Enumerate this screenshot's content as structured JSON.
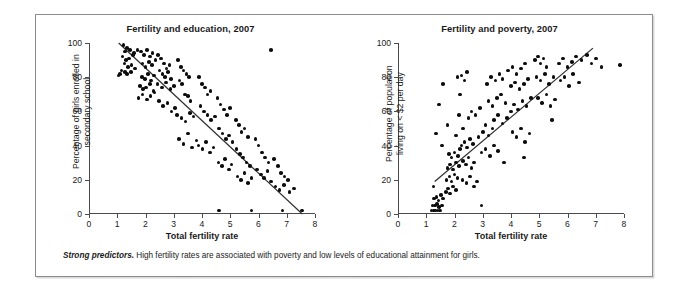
{
  "caption": {
    "lead": "Strong predictors.",
    "text": " High fertility rates are associated with poverty and low levels of educational attainment for girls."
  },
  "chart_data": [
    {
      "type": "scatter",
      "id": "fertility-education",
      "title": "Fertility and education, 2007",
      "xlabel": "Total fertility rate",
      "ylabel": "Percentage of girls enrolled in\nsecondary school",
      "xlim": [
        0,
        8
      ],
      "ylim": [
        0,
        100
      ],
      "xticks": [
        0,
        1,
        2,
        3,
        4,
        5,
        6,
        7,
        8
      ],
      "yticks": [
        0,
        20,
        40,
        60,
        80,
        100
      ],
      "grid": false,
      "legend": "none",
      "point_color": "#0d0d0d",
      "trendline": {
        "x0": 1.05,
        "y0": 100,
        "x1": 7.55,
        "y1": 0,
        "color": "#2e2e33"
      },
      "points": [
        [
          1.22,
          99
        ],
        [
          1.35,
          97
        ],
        [
          1.28,
          95
        ],
        [
          1.45,
          96
        ],
        [
          1.55,
          93
        ],
        [
          1.18,
          92
        ],
        [
          1.3,
          90
        ],
        [
          1.42,
          91
        ],
        [
          1.6,
          94
        ],
        [
          1.72,
          96
        ],
        [
          1.25,
          88
        ],
        [
          1.38,
          86
        ],
        [
          1.5,
          87
        ],
        [
          1.15,
          84
        ],
        [
          1.28,
          83
        ],
        [
          1.1,
          82
        ],
        [
          1.05,
          81
        ],
        [
          1.35,
          82
        ],
        [
          1.48,
          83
        ],
        [
          1.62,
          85
        ],
        [
          1.85,
          95
        ],
        [
          1.95,
          93
        ],
        [
          2.05,
          96
        ],
        [
          2.15,
          92
        ],
        [
          2.25,
          94
        ],
        [
          1.9,
          88
        ],
        [
          2.0,
          86
        ],
        [
          2.12,
          89
        ],
        [
          2.22,
          87
        ],
        [
          2.35,
          90
        ],
        [
          1.88,
          80
        ],
        [
          1.98,
          79
        ],
        [
          2.08,
          82
        ],
        [
          2.2,
          78
        ],
        [
          2.3,
          81
        ],
        [
          1.8,
          75
        ],
        [
          1.92,
          73
        ],
        [
          2.02,
          74
        ],
        [
          2.15,
          76
        ],
        [
          2.28,
          72
        ],
        [
          1.75,
          68
        ],
        [
          1.9,
          70
        ],
        [
          2.05,
          67
        ],
        [
          2.18,
          69
        ],
        [
          2.32,
          71
        ],
        [
          2.45,
          93
        ],
        [
          2.55,
          91
        ],
        [
          2.65,
          88
        ],
        [
          2.75,
          85
        ],
        [
          2.85,
          87
        ],
        [
          2.5,
          84
        ],
        [
          2.6,
          82
        ],
        [
          2.7,
          80
        ],
        [
          2.8,
          83
        ],
        [
          2.9,
          79
        ],
        [
          2.42,
          76
        ],
        [
          2.58,
          74
        ],
        [
          2.72,
          77
        ],
        [
          2.88,
          73
        ],
        [
          3.0,
          75
        ],
        [
          2.48,
          66
        ],
        [
          2.62,
          63
        ],
        [
          2.78,
          65
        ],
        [
          2.92,
          60
        ],
        [
          3.05,
          62
        ],
        [
          3.15,
          90
        ],
        [
          3.25,
          86
        ],
        [
          3.35,
          84
        ],
        [
          3.45,
          82
        ],
        [
          3.55,
          80
        ],
        [
          3.2,
          78
        ],
        [
          3.3,
          76
        ],
        [
          3.4,
          70
        ],
        [
          3.5,
          69
        ],
        [
          3.6,
          66
        ],
        [
          3.12,
          58
        ],
        [
          3.28,
          56
        ],
        [
          3.42,
          54
        ],
        [
          3.58,
          59
        ],
        [
          3.7,
          57
        ],
        [
          3.18,
          44
        ],
        [
          3.35,
          41
        ],
        [
          3.5,
          47
        ],
        [
          3.65,
          39
        ],
        [
          3.8,
          43
        ],
        [
          3.9,
          80
        ],
        [
          4.0,
          76
        ],
        [
          4.1,
          74
        ],
        [
          4.2,
          70
        ],
        [
          4.3,
          72
        ],
        [
          3.95,
          63
        ],
        [
          4.08,
          60
        ],
        [
          4.2,
          58
        ],
        [
          4.32,
          55
        ],
        [
          4.45,
          57
        ],
        [
          3.88,
          40
        ],
        [
          4.02,
          38
        ],
        [
          4.15,
          42
        ],
        [
          4.28,
          36
        ],
        [
          4.4,
          39
        ],
        [
          4.55,
          68
        ],
        [
          4.65,
          64
        ],
        [
          4.78,
          61
        ],
        [
          4.88,
          58
        ],
        [
          5.0,
          62
        ],
        [
          4.6,
          50
        ],
        [
          4.72,
          47
        ],
        [
          4.85,
          44
        ],
        [
          4.95,
          46
        ],
        [
          5.08,
          42
        ],
        [
          4.58,
          30
        ],
        [
          4.7,
          28
        ],
        [
          4.82,
          32
        ],
        [
          4.95,
          26
        ],
        [
          5.05,
          29
        ],
        [
          5.2,
          55
        ],
        [
          5.3,
          52
        ],
        [
          5.4,
          48
        ],
        [
          5.5,
          50
        ],
        [
          5.62,
          45
        ],
        [
          5.22,
          38
        ],
        [
          5.35,
          35
        ],
        [
          5.45,
          33
        ],
        [
          5.58,
          30
        ],
        [
          5.7,
          28
        ],
        [
          5.25,
          22
        ],
        [
          5.38,
          20
        ],
        [
          5.5,
          24
        ],
        [
          5.62,
          18
        ],
        [
          5.75,
          21
        ],
        [
          5.9,
          44
        ],
        [
          6.0,
          40
        ],
        [
          6.12,
          36
        ],
        [
          6.22,
          33
        ],
        [
          6.35,
          30
        ],
        [
          5.95,
          26
        ],
        [
          6.08,
          23
        ],
        [
          6.2,
          21
        ],
        [
          6.32,
          25
        ],
        [
          6.45,
          19
        ],
        [
          6.55,
          32
        ],
        [
          6.68,
          28
        ],
        [
          6.8,
          24
        ],
        [
          6.92,
          22
        ],
        [
          7.05,
          20
        ],
        [
          6.6,
          16
        ],
        [
          6.75,
          14
        ],
        [
          6.9,
          17
        ],
        [
          7.1,
          13
        ],
        [
          7.25,
          15
        ],
        [
          6.45,
          96
        ],
        [
          5.75,
          2
        ],
        [
          6.85,
          2
        ],
        [
          7.55,
          2
        ],
        [
          4.6,
          2
        ]
      ]
    },
    {
      "type": "scatter",
      "id": "fertility-poverty",
      "title": "Fertility and poverty, 2007",
      "xlabel": "Total fertility rate",
      "ylabel": "Percentage of population\nliving on < $2 per day",
      "xlim": [
        0,
        8
      ],
      "ylim": [
        0,
        100
      ],
      "xticks": [
        0,
        1,
        2,
        3,
        4,
        5,
        6,
        7,
        8
      ],
      "yticks": [
        0,
        20,
        40,
        60,
        80,
        100
      ],
      "grid": false,
      "legend": "none",
      "point_color": "#0d0d0d",
      "trendline": {
        "x0": 1.3,
        "y0": 19,
        "x1": 6.9,
        "y1": 97,
        "color": "#2e2e33"
      },
      "points": [
        [
          1.18,
          2
        ],
        [
          1.25,
          2
        ],
        [
          1.32,
          2
        ],
        [
          1.4,
          2
        ],
        [
          1.48,
          2
        ],
        [
          1.22,
          5
        ],
        [
          1.3,
          5
        ],
        [
          1.38,
          6
        ],
        [
          1.45,
          4
        ],
        [
          1.55,
          5
        ],
        [
          1.28,
          9
        ],
        [
          1.36,
          10
        ],
        [
          1.44,
          8
        ],
        [
          1.52,
          11
        ],
        [
          1.6,
          9
        ],
        [
          1.7,
          13
        ],
        [
          1.78,
          15
        ],
        [
          1.85,
          12
        ],
        [
          1.95,
          16
        ],
        [
          2.05,
          14
        ],
        [
          1.72,
          20
        ],
        [
          1.82,
          22
        ],
        [
          1.9,
          19
        ],
        [
          2.0,
          23
        ],
        [
          2.1,
          21
        ],
        [
          1.75,
          27
        ],
        [
          1.85,
          29
        ],
        [
          1.95,
          26
        ],
        [
          2.05,
          30
        ],
        [
          2.15,
          28
        ],
        [
          1.8,
          35
        ],
        [
          1.9,
          33
        ],
        [
          2.0,
          36
        ],
        [
          2.12,
          34
        ],
        [
          2.2,
          38
        ],
        [
          2.25,
          40
        ],
        [
          2.35,
          42
        ],
        [
          2.45,
          39
        ],
        [
          2.55,
          44
        ],
        [
          2.65,
          41
        ],
        [
          2.3,
          31
        ],
        [
          2.4,
          29
        ],
        [
          2.5,
          33
        ],
        [
          2.6,
          27
        ],
        [
          2.7,
          30
        ],
        [
          2.28,
          20
        ],
        [
          2.42,
          18
        ],
        [
          2.55,
          22
        ],
        [
          2.68,
          16
        ],
        [
          2.8,
          19
        ],
        [
          1.45,
          64
        ],
        [
          1.6,
          76
        ],
        [
          1.35,
          47
        ],
        [
          1.55,
          40
        ],
        [
          1.75,
          52
        ],
        [
          2.1,
          80
        ],
        [
          2.25,
          81
        ],
        [
          2.45,
          83
        ],
        [
          2.35,
          78
        ],
        [
          2.2,
          70
        ],
        [
          2.3,
          50
        ],
        [
          2.5,
          56
        ],
        [
          2.6,
          60
        ],
        [
          2.75,
          58
        ],
        [
          2.9,
          62
        ],
        [
          2.85,
          45
        ],
        [
          3.0,
          48
        ],
        [
          3.1,
          52
        ],
        [
          3.2,
          46
        ],
        [
          3.35,
          50
        ],
        [
          2.95,
          36
        ],
        [
          3.1,
          38
        ],
        [
          3.25,
          34
        ],
        [
          3.4,
          40
        ],
        [
          3.55,
          37
        ],
        [
          3.15,
          76
        ],
        [
          3.3,
          80
        ],
        [
          3.45,
          78
        ],
        [
          3.6,
          82
        ],
        [
          3.7,
          79
        ],
        [
          3.2,
          66
        ],
        [
          3.35,
          63
        ],
        [
          3.5,
          68
        ],
        [
          3.65,
          70
        ],
        [
          3.8,
          65
        ],
        [
          3.4,
          55
        ],
        [
          3.55,
          58
        ],
        [
          3.7,
          53
        ],
        [
          3.85,
          56
        ],
        [
          4.0,
          60
        ],
        [
          3.9,
          84
        ],
        [
          4.05,
          86
        ],
        [
          4.2,
          82
        ],
        [
          4.35,
          85
        ],
        [
          4.5,
          88
        ],
        [
          4.0,
          75
        ],
        [
          4.15,
          77
        ],
        [
          4.3,
          73
        ],
        [
          4.45,
          76
        ],
        [
          4.6,
          79
        ],
        [
          4.1,
          64
        ],
        [
          4.25,
          61
        ],
        [
          4.4,
          66
        ],
        [
          4.55,
          63
        ],
        [
          4.7,
          68
        ],
        [
          4.05,
          48
        ],
        [
          4.2,
          45
        ],
        [
          4.35,
          50
        ],
        [
          4.5,
          42
        ],
        [
          4.65,
          47
        ],
        [
          4.85,
          90
        ],
        [
          4.95,
          92
        ],
        [
          5.05,
          88
        ],
        [
          5.15,
          91
        ],
        [
          5.25,
          86
        ],
        [
          4.9,
          80
        ],
        [
          5.05,
          78
        ],
        [
          5.2,
          82
        ],
        [
          5.35,
          76
        ],
        [
          5.5,
          80
        ],
        [
          4.95,
          68
        ],
        [
          5.1,
          65
        ],
        [
          5.25,
          70
        ],
        [
          5.4,
          63
        ],
        [
          5.55,
          67
        ],
        [
          5.7,
          88
        ],
        [
          5.85,
          91
        ],
        [
          6.0,
          86
        ],
        [
          6.15,
          89
        ],
        [
          6.3,
          92
        ],
        [
          5.75,
          78
        ],
        [
          5.9,
          80
        ],
        [
          6.05,
          75
        ],
        [
          6.2,
          82
        ],
        [
          6.4,
          77
        ],
        [
          6.5,
          90
        ],
        [
          6.7,
          93
        ],
        [
          6.85,
          88
        ],
        [
          7.0,
          91
        ],
        [
          7.2,
          86
        ],
        [
          7.85,
          87
        ],
        [
          5.45,
          55
        ],
        [
          3.75,
          30
        ],
        [
          2.95,
          5
        ],
        [
          4.45,
          33
        ],
        [
          1.25,
          16
        ],
        [
          2.05,
          46
        ],
        [
          2.15,
          58
        ]
      ]
    }
  ]
}
